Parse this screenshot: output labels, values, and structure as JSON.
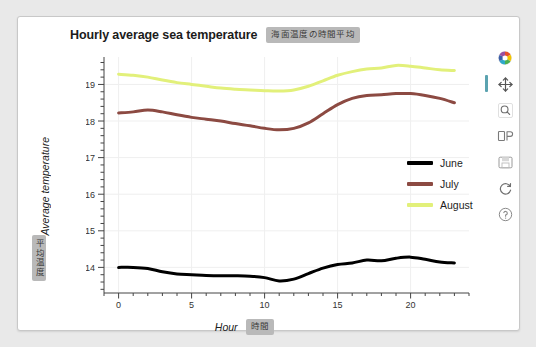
{
  "page": {
    "background_color": "#e9e9e9",
    "card_background": "#ffffff"
  },
  "header": {
    "title": "Hourly average sea temperature",
    "title_badge_jp": "海面温度の時間平均"
  },
  "axes": {
    "y_title": "Average temperature",
    "y_title_badge_jp": "平均温度",
    "x_title": "Hour",
    "x_title_badge_jp": "時間"
  },
  "legend": {
    "items": [
      {
        "label": "June",
        "color": "#000000"
      },
      {
        "label": "July",
        "color": "#8c4a42"
      },
      {
        "label": "August",
        "color": "#e2f07a"
      }
    ]
  },
  "modebar": {
    "buttons": [
      {
        "name": "plotly-logo-icon",
        "title": "Produced with Plotly"
      },
      {
        "name": "pan-icon",
        "title": "Pan"
      },
      {
        "name": "zoom-icon",
        "title": "Zoom"
      },
      {
        "name": "zoom-box-icon",
        "title": "Box Zoom"
      },
      {
        "name": "save-image-icon",
        "title": "Download plot as a png"
      },
      {
        "name": "reset-axes-icon",
        "title": "Reset axes"
      },
      {
        "name": "help-icon",
        "title": "Help"
      }
    ],
    "active_button": "pan-icon",
    "active_indicator_color": "#5ba3b0"
  },
  "chart_data": {
    "type": "line",
    "title": "Hourly average sea temperature",
    "xlabel": "Hour",
    "ylabel": "Average temperature",
    "xlim": [
      -1,
      24
    ],
    "ylim": [
      13.3,
      19.75
    ],
    "xticks": [
      0,
      5,
      10,
      15,
      20
    ],
    "yticks": [
      14,
      15,
      16,
      17,
      18,
      19
    ],
    "xtick_minor_step": 1,
    "ytick_minor_step": 0.2,
    "grid": true,
    "legend_position": "center-right",
    "x": [
      0,
      1,
      2,
      3,
      4,
      5,
      6,
      7,
      8,
      9,
      10,
      11,
      12,
      13,
      14,
      15,
      16,
      17,
      18,
      19,
      20,
      21,
      22,
      23
    ],
    "series": [
      {
        "name": "June",
        "color": "#000000",
        "values": [
          14.0,
          14.0,
          13.97,
          13.88,
          13.82,
          13.8,
          13.78,
          13.77,
          13.77,
          13.76,
          13.72,
          13.63,
          13.68,
          13.83,
          13.98,
          14.08,
          14.12,
          14.2,
          14.18,
          14.25,
          14.28,
          14.22,
          14.15,
          14.12
        ]
      },
      {
        "name": "July",
        "color": "#8c4a42",
        "values": [
          18.22,
          18.25,
          18.3,
          18.25,
          18.17,
          18.1,
          18.05,
          18.0,
          17.93,
          17.87,
          17.8,
          17.76,
          17.8,
          17.95,
          18.2,
          18.45,
          18.62,
          18.7,
          18.72,
          18.75,
          18.75,
          18.7,
          18.62,
          18.5
        ]
      },
      {
        "name": "August",
        "color": "#e2f07a",
        "values": [
          19.28,
          19.25,
          19.2,
          19.12,
          19.05,
          19.0,
          18.95,
          18.9,
          18.87,
          18.85,
          18.83,
          18.82,
          18.85,
          18.95,
          19.1,
          19.25,
          19.35,
          19.42,
          19.45,
          19.52,
          19.5,
          19.45,
          19.4,
          19.38
        ]
      }
    ]
  }
}
